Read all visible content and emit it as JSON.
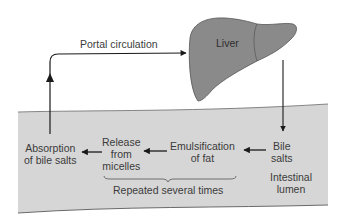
{
  "diagram": {
    "nodes": {
      "liver": "Liver",
      "bile_salts": [
        "Bile",
        "salts"
      ],
      "emulsification": [
        "Emulsification",
        "of fat"
      ],
      "release": [
        "Release",
        "from",
        "micelles"
      ],
      "absorption": [
        "Absorption",
        "of bile salts"
      ]
    },
    "edge_labels": {
      "portal": "Portal circulation",
      "repeated": "Repeated several times"
    },
    "region_label": [
      "Intestinal",
      "lumen"
    ],
    "colors": {
      "liver_fill": "#8a8a8a",
      "liver_stroke": "#555555",
      "lumen_fill": "#d6d6d6",
      "lumen_edge": "#6a6a6a",
      "arrow": "#1a1a1a",
      "text": "#3b3b3b"
    }
  }
}
